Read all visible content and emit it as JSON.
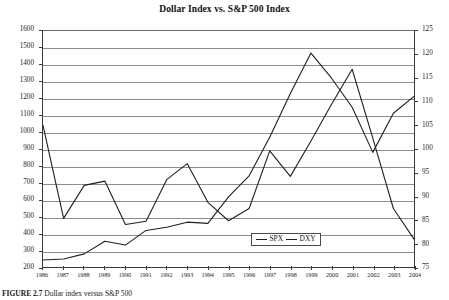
{
  "chart_data": {
    "type": "line",
    "title": "Dollar Index vs. S&P 500 Index",
    "xlabel": "",
    "ylabel": "",
    "grid": true,
    "legend_position": "bottom-center-inside",
    "x": [
      1986,
      1987,
      1988,
      1989,
      1990,
      1991,
      1992,
      1993,
      1994,
      1995,
      1996,
      1997,
      1998,
      1999,
      2000,
      2001,
      2002,
      2003,
      2004
    ],
    "xticklabels": [
      "1986",
      "1987",
      "1988",
      "1989",
      "1990",
      "1991",
      "1992",
      "1993",
      "1994",
      "1995",
      "1996",
      "1997",
      "1998",
      "1999",
      "2000",
      "2001",
      "2002",
      "2003",
      "2004"
    ],
    "left_axis": {
      "name": "SPX",
      "ylim": [
        200,
        1600
      ],
      "ticks": [
        200,
        300,
        400,
        500,
        600,
        700,
        800,
        900,
        1000,
        1100,
        1200,
        1300,
        1400,
        1500,
        1600
      ]
    },
    "right_axis": {
      "name": "DXY",
      "ylim": [
        75,
        125
      ],
      "ticks": [
        75,
        80,
        85,
        90,
        95,
        100,
        105,
        110,
        115,
        120,
        125
      ]
    },
    "series": [
      {
        "name": "SPX",
        "axis": "left",
        "values": [
          242,
          247,
          278,
          353,
          330,
          417,
          436,
          466,
          459,
          616,
          741,
          970,
          1229,
          1469,
          1320,
          1148,
          880,
          1112,
          1212
        ]
      },
      {
        "name": "DXY",
        "axis": "right",
        "values": [
          105.0,
          85.3,
          92.3,
          93.2,
          84.0,
          84.7,
          93.5,
          96.9,
          88.7,
          84.8,
          87.4,
          99.6,
          94.2,
          101.7,
          109.5,
          116.9,
          102.3,
          87.4,
          80.9
        ]
      }
    ]
  },
  "legend": {
    "entries": [
      {
        "label": "SPX",
        "color": "#1f1f1f"
      },
      {
        "label": "DXY",
        "color": "#1f1f1f"
      }
    ]
  },
  "caption": {
    "bold_part": "FIGURE 2.7",
    "rest": "  Dollar index versus S&P 500"
  }
}
